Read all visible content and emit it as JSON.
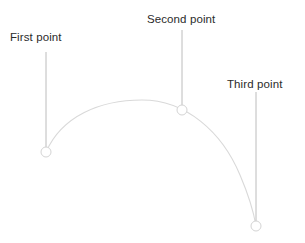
{
  "figure": {
    "background_color": "#ffffff",
    "curve_color": "#d9d9d9",
    "leader_line_color": "#b4b4b4",
    "marker_stroke_color": "#d4d4d4",
    "marker_fill_color": "#ffffff",
    "label_color": "#2b2b2b"
  },
  "labels": {
    "first": "First point",
    "second": "Second point",
    "third": "Third point"
  },
  "points": [
    {
      "name": "first",
      "label": "First point",
      "x": 46,
      "y": 152,
      "radius": 5
    },
    {
      "name": "second",
      "label": "Second point",
      "x": 182,
      "y": 110,
      "radius": 5
    },
    {
      "name": "third",
      "label": "Third point",
      "x": 256,
      "y": 226,
      "radius": 5
    }
  ],
  "leader_lines": [
    {
      "name": "first",
      "x": 46,
      "y_top": 52,
      "y_bottom": 152
    },
    {
      "name": "second",
      "x": 182,
      "y_top": 30,
      "y_bottom": 110
    },
    {
      "name": "third",
      "x": 256,
      "y_top": 92,
      "y_bottom": 226
    }
  ],
  "arc": {
    "start_x": 46,
    "start_y": 152,
    "apex_x": 142,
    "apex_y": 100,
    "end_x": 256,
    "end_y": 226,
    "path": "M 46 152 C 62 116 100 100 142 100 C 186 100 222 132 240 175 C 249 196 254 214 256 226"
  }
}
